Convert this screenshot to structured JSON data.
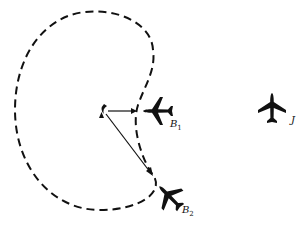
{
  "diagram": {
    "labels": {
      "b1": {
        "main": "B",
        "sub": "1"
      },
      "b2": {
        "main": "B",
        "sub": "2"
      },
      "j": {
        "main": "J"
      }
    },
    "colors": {
      "ink": "#111111",
      "background": "#ffffff"
    }
  }
}
